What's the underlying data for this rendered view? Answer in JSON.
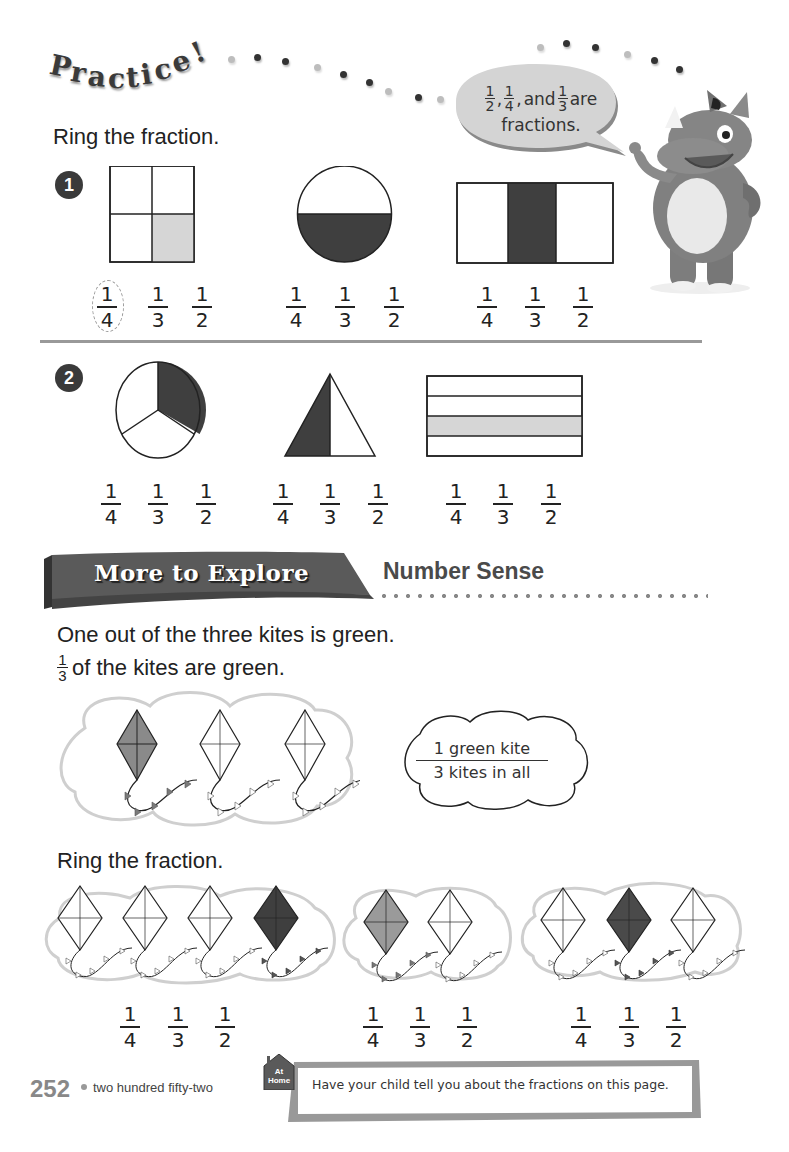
{
  "header": {
    "title_letters": [
      "P",
      "r",
      "a",
      "c",
      "t",
      "i",
      "c",
      "e",
      "!"
    ],
    "speech_bubble": {
      "fractions": [
        {
          "n": "1",
          "d": "2"
        },
        {
          "n": "1",
          "d": "4"
        },
        {
          "n": "1",
          "d": "3"
        }
      ],
      "and_text": "and",
      "are_text": "are",
      "line2": "fractions."
    },
    "mascot": "rhino-mascot"
  },
  "practice": {
    "instruction": "Ring the fraction.",
    "problems": [
      {
        "number": "1",
        "items": [
          {
            "shape": "square-4-parts",
            "shaded": "1 of 4 (light)",
            "choices": [
              {
                "n": "1",
                "d": "4"
              },
              {
                "n": "1",
                "d": "3"
              },
              {
                "n": "1",
                "d": "2"
              }
            ],
            "ringed": "1/4"
          },
          {
            "shape": "circle-2-parts",
            "shaded": "1 of 2 (dark)",
            "choices": [
              {
                "n": "1",
                "d": "4"
              },
              {
                "n": "1",
                "d": "3"
              },
              {
                "n": "1",
                "d": "2"
              }
            ],
            "ringed": ""
          },
          {
            "shape": "rectangle-3-columns",
            "shaded": "1 of 3 (dark)",
            "choices": [
              {
                "n": "1",
                "d": "4"
              },
              {
                "n": "1",
                "d": "3"
              },
              {
                "n": "1",
                "d": "2"
              }
            ],
            "ringed": ""
          }
        ]
      },
      {
        "number": "2",
        "items": [
          {
            "shape": "circle-3-parts",
            "shaded": "1 of 3 (dark)",
            "choices": [
              {
                "n": "1",
                "d": "4"
              },
              {
                "n": "1",
                "d": "3"
              },
              {
                "n": "1",
                "d": "2"
              }
            ],
            "ringed": ""
          },
          {
            "shape": "triangle-2-parts",
            "shaded": "1 of 2 (dark)",
            "choices": [
              {
                "n": "1",
                "d": "4"
              },
              {
                "n": "1",
                "d": "3"
              },
              {
                "n": "1",
                "d": "2"
              }
            ],
            "ringed": ""
          },
          {
            "shape": "rectangle-4-rows",
            "shaded": "1 of 4 (light)",
            "choices": [
              {
                "n": "1",
                "d": "4"
              },
              {
                "n": "1",
                "d": "3"
              },
              {
                "n": "1",
                "d": "2"
              }
            ],
            "ringed": ""
          }
        ]
      }
    ]
  },
  "explore": {
    "banner": "More to Explore",
    "subtitle": "Number Sense",
    "line1": "One out of the three kites is green.",
    "line2_fraction": {
      "n": "1",
      "d": "3"
    },
    "line2_text": "of the kites are green.",
    "cloud_numerator": "1 green kite",
    "cloud_denominator": "3 kites in all",
    "instruction": "Ring the fraction.",
    "groups": [
      {
        "kites": 4,
        "shaded_index": 3,
        "choices": [
          {
            "n": "1",
            "d": "4"
          },
          {
            "n": "1",
            "d": "3"
          },
          {
            "n": "1",
            "d": "2"
          }
        ]
      },
      {
        "kites": 2,
        "shaded_index": 0,
        "choices": [
          {
            "n": "1",
            "d": "4"
          },
          {
            "n": "1",
            "d": "3"
          },
          {
            "n": "1",
            "d": "2"
          }
        ]
      },
      {
        "kites": 3,
        "shaded_index": 1,
        "choices": [
          {
            "n": "1",
            "d": "4"
          },
          {
            "n": "1",
            "d": "3"
          },
          {
            "n": "1",
            "d": "2"
          }
        ]
      }
    ]
  },
  "footer": {
    "page_number": "252",
    "page_words": "two hundred fifty-two",
    "at_home_badge_line1": "At",
    "at_home_badge_line2": "Home",
    "at_home_text": "Have your child tell you about the fractions on this page."
  },
  "colors": {
    "dark_fill": "#3f3f3f",
    "light_fill": "#d6d6d6",
    "mid_fill": "#9a9a9a",
    "cloud_outline": "#cfcfcf",
    "banner": "#5a5a5a"
  }
}
